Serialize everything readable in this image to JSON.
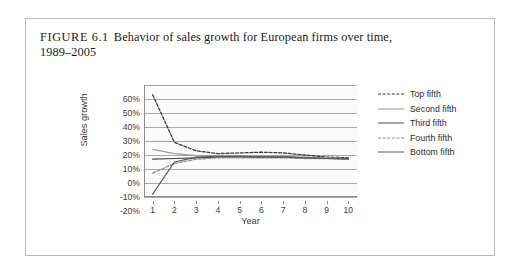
{
  "figure": {
    "label": "FIGURE 6.1",
    "title": "Behavior of sales growth for European firms over time,",
    "title_line2": "1989–2005"
  },
  "chart_data": {
    "type": "line",
    "title": "Behavior of sales growth for European firms over time, 1989–2005",
    "xlabel": "Year",
    "ylabel": "Sales growth",
    "x": [
      1,
      2,
      3,
      4,
      5,
      6,
      7,
      8,
      9,
      10
    ],
    "xlim": [
      0.6,
      10.4
    ],
    "ylim": [
      -20,
      60
    ],
    "xticks": [
      "1",
      "2",
      "3",
      "4",
      "5",
      "6",
      "7",
      "8",
      "9",
      "10"
    ],
    "yticks": [
      "60%",
      "50%",
      "40%",
      "30%",
      "20%",
      "10%",
      "0%",
      "-10%",
      "-20%"
    ],
    "ytick_values": [
      60,
      50,
      40,
      30,
      20,
      10,
      0,
      -10,
      -20
    ],
    "grid": true,
    "grid_axis": "y",
    "legend_position": "right",
    "series": [
      {
        "name": "Top fifth",
        "style": "dashed",
        "color": "#3a3a3a",
        "values": [
          53,
          19,
          13,
          11,
          11.5,
          12,
          11.5,
          10,
          8.5,
          8
        ]
      },
      {
        "name": "Second fifth",
        "style": "solid",
        "color": "#9a9a9a",
        "values": [
          14,
          11,
          9.5,
          9,
          9,
          9,
          9,
          8.5,
          8,
          7.5
        ]
      },
      {
        "name": "Third fifth",
        "style": "solid",
        "color": "#4a4a4a",
        "values": [
          7,
          7.5,
          8,
          8.5,
          8.5,
          8.5,
          8.5,
          8,
          7.5,
          7.5
        ]
      },
      {
        "name": "Fourth fifth",
        "style": "dashed",
        "color": "#8f8f8f",
        "values": [
          -3,
          4,
          7,
          8,
          8,
          8,
          8,
          7.5,
          7.5,
          7
        ]
      },
      {
        "name": "Bottom fifth",
        "style": "solid",
        "color": "#5a5a5a",
        "values": [
          -18,
          5,
          8.5,
          9,
          9,
          8.5,
          8.5,
          8,
          7.5,
          7
        ]
      }
    ]
  }
}
